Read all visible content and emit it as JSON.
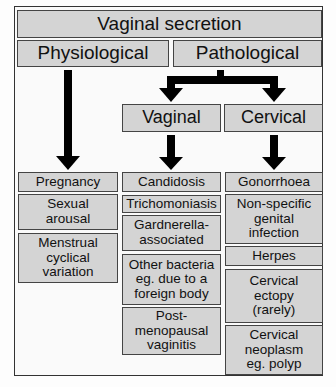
{
  "title": "Vaginal secretion",
  "categories": {
    "physiological": "Physiological",
    "pathological": "Pathological"
  },
  "subcategories": {
    "vaginal": "Vaginal",
    "cervical": "Cervical"
  },
  "physiological_causes": [
    "Pregnancy",
    "Sexual arousal",
    "Menstrual cyclical variation"
  ],
  "vaginal_causes": [
    "Candidosis",
    "Trichomoniasis",
    "Gardnerella-associated",
    "Other bacteria eg. due to a foreign body",
    "Post-menopausal vaginitis"
  ],
  "cervical_causes": [
    "Gonorrhoea",
    "Non-specific genital infection",
    "Herpes",
    "Cervical ectopy (rarely)",
    "Cervical neoplasm eg. polyp"
  ],
  "display_lines": {
    "physiological": [
      [
        "Pregnancy"
      ],
      [
        "Sexual",
        "arousal"
      ],
      [
        "Menstrual",
        "cyclical",
        "variation"
      ]
    ],
    "vaginal": [
      [
        "Candidosis"
      ],
      [
        "Trichomoniasis"
      ],
      [
        "Gardnerella-",
        "associated"
      ],
      [
        "Other bacteria",
        "eg. due to a",
        "foreign body"
      ],
      [
        "Post-",
        "menopausal",
        "vaginitis"
      ]
    ],
    "cervical": [
      [
        "Gonorrhoea"
      ],
      [
        "Non-specific",
        "genital",
        "infection"
      ],
      [
        "Herpes"
      ],
      [
        "Cervical",
        "ectopy",
        "(rarely)"
      ],
      [
        "Cervical",
        "neoplasm",
        "eg. polyp"
      ]
    ]
  },
  "colors": {
    "box_fill": "#d4d4d4",
    "arrow": "#000000",
    "border": "#444444"
  }
}
